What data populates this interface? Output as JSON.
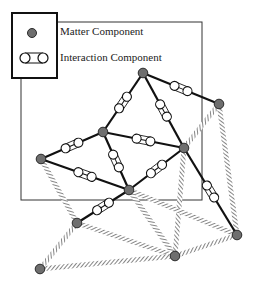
{
  "legend": {
    "matter_label": "Matter Component",
    "interaction_label": "Interaction Component"
  },
  "colors": {
    "node_fill": "#6e6e6e",
    "node_stroke": "#2a2a2a",
    "edge": "#111111",
    "hatch": "#777777",
    "frame": "#333333"
  },
  "nodes": [
    {
      "id": "top",
      "x": 143,
      "y": 73
    },
    {
      "id": "right",
      "x": 219,
      "y": 104
    },
    {
      "id": "midleft",
      "x": 103,
      "y": 132
    },
    {
      "id": "left",
      "x": 41,
      "y": 159
    },
    {
      "id": "midright",
      "x": 184,
      "y": 148
    },
    {
      "id": "center",
      "x": 129,
      "y": 190
    },
    {
      "id": "lowerleft",
      "x": 77,
      "y": 223
    },
    {
      "id": "bottomleft",
      "x": 40,
      "y": 269
    },
    {
      "id": "bottom",
      "x": 175,
      "y": 256
    },
    {
      "id": "bottomright",
      "x": 237,
      "y": 235
    }
  ],
  "interaction_edges": [
    [
      "top",
      "right"
    ],
    [
      "top",
      "midleft"
    ],
    [
      "top",
      "midright"
    ],
    [
      "midleft",
      "left"
    ],
    [
      "midleft",
      "midright"
    ],
    [
      "midleft",
      "center"
    ],
    [
      "left",
      "center"
    ],
    [
      "midright",
      "center"
    ],
    [
      "midright",
      "bottomright"
    ],
    [
      "center",
      "lowerleft"
    ]
  ],
  "hatched_edges": [
    [
      "right",
      "midright"
    ],
    [
      "right",
      "bottomright"
    ],
    [
      "midright",
      "bottom"
    ],
    [
      "left",
      "lowerleft"
    ],
    [
      "center",
      "bottomright"
    ],
    [
      "center",
      "bottom"
    ],
    [
      "lowerleft",
      "bottom"
    ],
    [
      "bottom",
      "bottomright"
    ],
    [
      "bottomleft",
      "bottom"
    ],
    [
      "bottomleft",
      "lowerleft"
    ]
  ]
}
